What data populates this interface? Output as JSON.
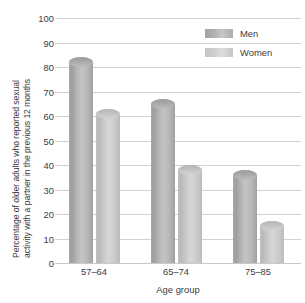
{
  "chart_data": {
    "type": "bar",
    "title": "",
    "subtitle": "",
    "categories": [
      "57–64",
      "65–74",
      "75–85"
    ],
    "series": [
      {
        "name": "Men",
        "color": "#b0b0b0",
        "values": [
          82,
          65,
          36
        ]
      },
      {
        "name": "Women",
        "color": "#cccccc",
        "values": [
          61,
          38,
          15
        ]
      }
    ],
    "xlabel": "Age group",
    "ylabel": "Percentage of older adults who reported sexual activity with a partner in the previous 12 months",
    "ylabel_line1": "Percentage of older adults who reported sexual",
    "ylabel_line2": "activity with a partner in the previous 12 months",
    "ylim": [
      0,
      100
    ],
    "ytick_step": 10,
    "yticks": [
      "0",
      "10",
      "20",
      "30",
      "40",
      "50",
      "60",
      "70",
      "80",
      "90",
      "100"
    ],
    "grid": true,
    "grid_axis": "y",
    "legend_position": "top-right"
  },
  "legend": {
    "entries": [
      {
        "label": "Men"
      },
      {
        "label": "Women"
      }
    ]
  }
}
